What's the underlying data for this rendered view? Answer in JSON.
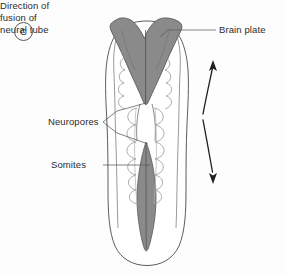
{
  "figure": {
    "panel_letter": "C",
    "caption_topic": "Neural tube fusion in the embryo",
    "background_color": "#fdfdfd",
    "outline_color": "#4a4a4a",
    "shaded_structure_color": "#8a8a8a",
    "shaded_structure_outline": "#5b5b5b",
    "text_color": "#2b2b2b"
  },
  "labels": {
    "brain_plate": "Brain plate",
    "neuropores": "Neuropores",
    "somites": "Somites",
    "direction_line1": "Direction of",
    "direction_line2": "fusion of",
    "direction_line3": "neural tube"
  },
  "structures": [
    {
      "name": "embryo-outline",
      "description": "Outline of flat embryo, elongated oval flared at the cranial end, rounded at the caudal end"
    },
    {
      "name": "brain-plate",
      "description": "Shaded V / heart-shaped neural plate of the future brain at the cranial end",
      "fill": "#8a8a8a"
    },
    {
      "name": "anterior-neuropore",
      "description": "Open cranial end of the neural groove at the apex of the brain plate"
    },
    {
      "name": "posterior-neuropore",
      "description": "Shaded spindle-shaped open caudal end of the neural groove",
      "fill": "#8a8a8a"
    },
    {
      "name": "somites",
      "description": "Paired scalloped blocks of paraxial mesoderm flanking the closing neural tube"
    },
    {
      "name": "fusion-arrows",
      "description": "Two curved arrows, one pointing cranially and one caudally, showing bidirectional zipper-like fusion of the neural tube"
    }
  ],
  "arrows": [
    {
      "name": "upward-fusion-arrow",
      "direction": "up"
    },
    {
      "name": "downward-fusion-arrow",
      "direction": "down"
    }
  ]
}
